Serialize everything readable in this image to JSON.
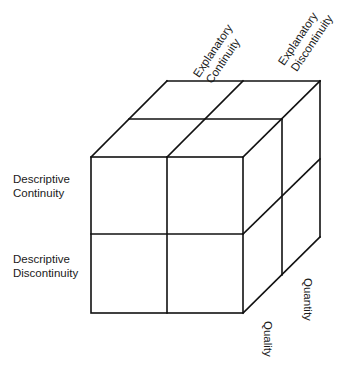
{
  "diagram": {
    "type": "3d-cube-2x2x2",
    "line_color": "#111111",
    "background": "#ffffff",
    "labels": {
      "front_rows": [
        {
          "line1": "Descriptive",
          "line2": "Continuity"
        },
        {
          "line1": "Descriptive",
          "line2": "Discontinuity"
        }
      ],
      "top_columns": [
        {
          "line1": "Explanatory",
          "line2": "Continuity"
        },
        {
          "line1": "Explanatory",
          "line2": "Discontinuity"
        }
      ],
      "side_axes": {
        "depth_axis": "Quantity",
        "front_axis": "Quality"
      }
    }
  }
}
